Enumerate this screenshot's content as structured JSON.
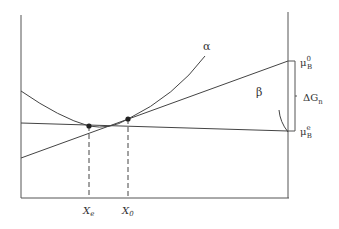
{
  "diagram": {
    "curves": {
      "alpha_label": "α",
      "beta_label": "β"
    },
    "x_labels": {
      "xe": "X",
      "xe_sub": "e",
      "x0": "X",
      "x0_sub": "0"
    },
    "right_labels": {
      "mu_top": "μ",
      "mu_top_sub": "B",
      "mu_top_sup": "0",
      "delta": "ΔG",
      "delta_sub": "n",
      "mu_bot": "μ",
      "mu_bot_sub": "B",
      "mu_bot_sup": "e"
    },
    "colors": {
      "line": "#444444"
    }
  }
}
